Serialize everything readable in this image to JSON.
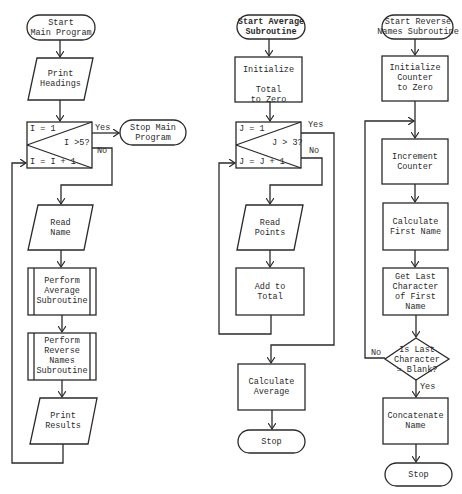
{
  "colors": {
    "stroke": "#2a2a2a",
    "background": "#ffffff"
  },
  "main_program": {
    "start": "Start\nMain Program",
    "print_headings": "Print\nHeadings",
    "loop": {
      "init": "I = 1",
      "test": "I >5?",
      "increment": "I = I + 1",
      "yes": "Yes",
      "no": "No"
    },
    "stop": "Stop Main\nProgram",
    "read_name": "Read\nName",
    "perform_average": "Perform\nAverage\nSubroutine",
    "perform_reverse": "Perform\nReverse\nNames\nSubroutine",
    "print_results": "Print\nResults"
  },
  "average_subroutine": {
    "start": "Start Average\nSubroutine",
    "initialize": "Initialize\n\nTotal\nto Zero",
    "loop": {
      "init": "J = 1",
      "test": "J > 3?",
      "increment": "J = J + 1",
      "yes": "Yes",
      "no": "No"
    },
    "read_points": "Read\nPoints",
    "add_to_total": "Add to\nTotal",
    "calculate_average": "Calculate\nAverage",
    "stop": "Stop"
  },
  "reverse_names_subroutine": {
    "start": "Start Reverse\nNames Subroutine",
    "initialize": "Initialize\nCounter\nto Zero",
    "increment": "Increment\nCounter",
    "calculate_first_name": "Calculate\nFirst Name",
    "get_last_char": "Get Last\nCharacter\nof First\nName",
    "decision": "Is Last\nCharacter\n= Blank?",
    "decision_yes": "Yes",
    "decision_no": "No",
    "concatenate": "Concatenate\nName",
    "stop": "Stop"
  }
}
